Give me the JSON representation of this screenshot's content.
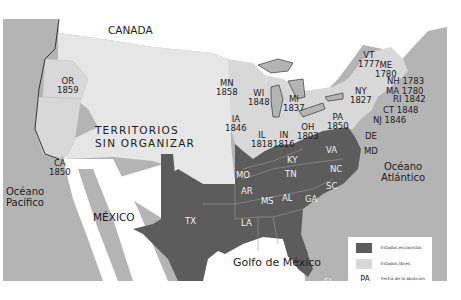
{
  "map": {
    "title_labels": {
      "canada": "CANADA",
      "mexico": "MÉXICO",
      "pacific": [
        "Océano",
        "Pacífico"
      ],
      "atlantic": [
        "Océano",
        "Atlántico"
      ],
      "gulf": "Golfo de México",
      "territories": [
        "TERRITORIOS",
        "SIN ORGANIZAR"
      ]
    },
    "colors": {
      "slave_states": "#5c5c5c",
      "free_states": "#d8d8d8",
      "territories": "#e6e6e6",
      "water": "#b4b4b4",
      "foreign_land": "#ffffff"
    },
    "free_states": [
      {
        "abbr": "OR",
        "year": "1859"
      },
      {
        "abbr": "CA",
        "year": "1850"
      },
      {
        "abbr": "MN",
        "year": "1858"
      },
      {
        "abbr": "WI",
        "year": "1848"
      },
      {
        "abbr": "MI",
        "year": "1837"
      },
      {
        "abbr": "IA",
        "year": "1846"
      },
      {
        "abbr": "IL",
        "year": "1818"
      },
      {
        "abbr": "IN",
        "year": "1816"
      },
      {
        "abbr": "OH",
        "year": "1803"
      },
      {
        "abbr": "PA",
        "year": "1850"
      },
      {
        "abbr": "NY",
        "year": "1827"
      },
      {
        "abbr": "VT",
        "year": "1777"
      },
      {
        "abbr": "ME",
        "year": "1780"
      },
      {
        "abbr": "NH",
        "year": "1783"
      },
      {
        "abbr": "MA",
        "year": "1780"
      },
      {
        "abbr": "RI",
        "year": "1842"
      },
      {
        "abbr": "CT",
        "year": "1848"
      },
      {
        "abbr": "NJ",
        "year": "1846"
      }
    ],
    "slave_states": [
      "TX",
      "MO",
      "AR",
      "LA",
      "KY",
      "TN",
      "MS",
      "AL",
      "GA",
      "FL",
      "SC",
      "NC",
      "VA",
      "MD",
      "DE"
    ]
  },
  "legend": {
    "items": [
      {
        "label": "Estados esclavistas",
        "color": "#5c5c5c"
      },
      {
        "label": "Estados libres",
        "color": "#d8d8d8"
      }
    ],
    "example_abbr": "PA",
    "example_year": "1850",
    "example_label_1": "Fecha de la abolición",
    "example_label_2": "de la esclavitud"
  }
}
